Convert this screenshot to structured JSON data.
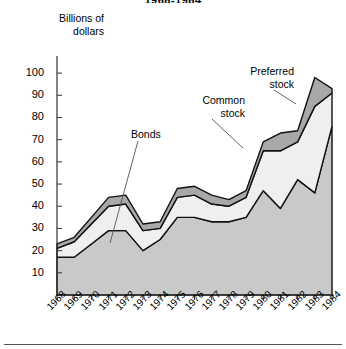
{
  "title": "1968-1984",
  "axis": {
    "y_title_line1": "Billions of",
    "y_title_line2": "dollars",
    "y_ticks": [
      "100",
      "90",
      "80",
      "70",
      "60",
      "50",
      "40",
      "30",
      "20",
      "10"
    ],
    "x_ticks": [
      "1968",
      "1969",
      "1970",
      "1971",
      "1972",
      "1973",
      "1974",
      "1975",
      "1976",
      "1977",
      "1978",
      "1979",
      "1980",
      "1981",
      "1982",
      "1983",
      "1984"
    ]
  },
  "annotations": {
    "bonds": "Bonds",
    "common_line1": "Common",
    "common_line2": "stock",
    "preferred_line1": "Preferred",
    "preferred_line2": "stock"
  },
  "colors": {
    "bonds_fill": "#c9c9c9",
    "common_fill": "#efefef",
    "preferred_fill": "#a8a8a8",
    "outline": "#111111",
    "axis": "#333333"
  },
  "chart_data": {
    "type": "area",
    "stacked": true,
    "title": "1968-1984",
    "xlabel": "",
    "ylabel": "Billions of dollars",
    "ylim": [
      0,
      105
    ],
    "grid": false,
    "legend": "annotated-callouts",
    "categories": [
      "1968",
      "1969",
      "1970",
      "1971",
      "1972",
      "1973",
      "1974",
      "1975",
      "1976",
      "1977",
      "1978",
      "1979",
      "1980",
      "1981",
      "1982",
      "1983",
      "1984"
    ],
    "series": [
      {
        "name": "Bonds",
        "values": [
          17,
          17,
          23,
          29,
          29,
          20,
          25,
          35,
          35,
          33,
          33,
          35,
          47,
          39,
          52,
          46,
          76
        ]
      },
      {
        "name": "Common stock",
        "values": [
          4,
          7,
          9,
          11,
          12,
          9,
          5,
          9,
          10,
          8,
          7,
          9,
          18,
          26,
          17,
          39,
          15
        ]
      },
      {
        "name": "Preferred stock",
        "values": [
          2,
          2,
          3,
          4,
          4,
          3,
          3,
          4,
          4,
          4,
          3,
          3,
          4,
          8,
          5,
          13,
          2
        ]
      }
    ],
    "totals": [
      23,
      26,
      35,
      44,
      45,
      32,
      33,
      48,
      49,
      45,
      43,
      47,
      69,
      73,
      74,
      98,
      93
    ]
  }
}
